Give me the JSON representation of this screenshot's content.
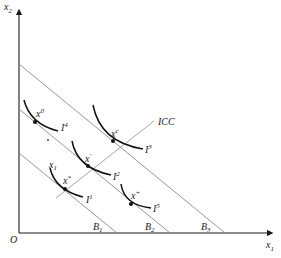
{
  "axes": {
    "y_label": "x",
    "y_label_sub": "2",
    "x_label": "x",
    "x_label_sub": "1",
    "origin_label": "O"
  },
  "budget_lines": [
    {
      "label": "B",
      "sub": "1"
    },
    {
      "label": "B",
      "sub": "2"
    },
    {
      "label": "B",
      "sub": "3"
    }
  ],
  "curve_label": "ICC",
  "indifference_curves": [
    {
      "label": "I",
      "sup": "4"
    },
    {
      "label": "I",
      "sup": "3"
    },
    {
      "label": "I",
      "sup": "2"
    },
    {
      "label": "I",
      "sup": "1"
    },
    {
      "label": "I",
      "sup": "5"
    }
  ],
  "points": [
    {
      "label": "x",
      "sup": "0"
    },
    {
      "label": "x",
      "sup": "c"
    },
    {
      "label": "x",
      "sup": "′"
    },
    {
      "label": "x",
      "sup": "*"
    },
    {
      "label": "x",
      "sup": "+"
    },
    {
      "label": "x",
      "sub": "1"
    }
  ],
  "colors": {
    "axis": "#1a1a1a",
    "budget_line": "#8a8a8a",
    "icc_line": "#9a9a9a",
    "curve": "#111111"
  }
}
